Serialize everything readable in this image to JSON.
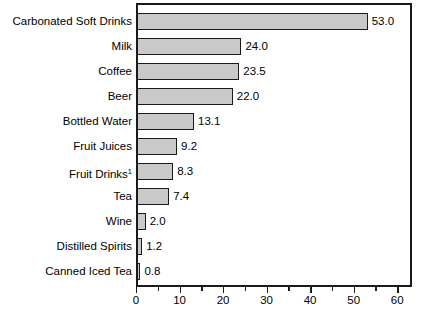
{
  "chart_data": {
    "type": "bar",
    "orientation": "horizontal",
    "title": "",
    "xlabel": "",
    "ylabel": "",
    "xlim": [
      0,
      63.4
    ],
    "grid": false,
    "legend": null,
    "bar_fill_color": "#c9c9c9",
    "bar_edge_color": "#1a1a1a",
    "background_color": "#ffffff",
    "xticks_major": [
      0,
      10,
      20,
      30,
      40,
      50,
      60
    ],
    "xticks_minor": [
      5,
      15,
      25,
      35,
      45,
      55
    ],
    "xtick_labels": [
      "0",
      "10",
      "20",
      "30",
      "40",
      "50",
      "60"
    ],
    "categories": [
      "Carbonated Soft Drinks",
      "Milk",
      "Coffee",
      "Beer",
      "Bottled Water",
      "Fruit Juices",
      "Fruit Drinks",
      "Tea",
      "Wine",
      "Distilled Spirits",
      "Canned Iced Tea"
    ],
    "values": [
      53.0,
      24.0,
      23.5,
      22.0,
      13.1,
      9.2,
      8.3,
      7.4,
      2.0,
      1.2,
      0.8
    ],
    "value_labels": [
      "53.0",
      "24.0",
      "23.5",
      "22.0",
      "13.1",
      "9.2",
      "8.3",
      "7.4",
      "2.0",
      "1.2",
      "0.8"
    ],
    "category_footnotes": [
      "",
      "",
      "",
      "",
      "",
      "",
      "1",
      "",
      "",
      "",
      ""
    ]
  }
}
